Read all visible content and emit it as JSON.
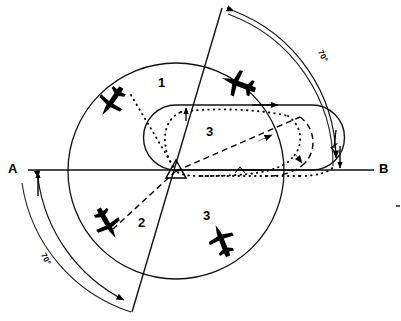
{
  "figure": {
    "type": "diagram",
    "background_color": "#ffffff",
    "line_color": "#000000"
  },
  "endpoints": {
    "left_label": "A",
    "right_label": "B"
  },
  "sector_labels": [
    {
      "id": "sector-1",
      "text": "1",
      "x": 158,
      "y": 76
    },
    {
      "id": "sector-2",
      "text": "2",
      "x": 138,
      "y": 216
    },
    {
      "id": "sector-3-upper",
      "text": "3",
      "x": 206,
      "y": 125
    },
    {
      "id": "sector-3-lower",
      "text": "3",
      "x": 203,
      "y": 209
    }
  ],
  "angle_labels": [
    {
      "id": "angle-top-right",
      "text": "70°",
      "x": 323,
      "y": 49,
      "rotation": 62
    },
    {
      "id": "angle-bottom-left",
      "text": "70°",
      "x": 46,
      "y": 252,
      "rotation": 62
    }
  ],
  "aircraft": [
    {
      "id": "aircraft-sector-1",
      "x": 112,
      "y": 101,
      "rotation": 125,
      "scale": 1.0
    },
    {
      "id": "aircraft-sector-3-upper",
      "x": 239,
      "y": 84,
      "rotation": 200,
      "scale": 1.05
    },
    {
      "id": "aircraft-sector-2",
      "x": 107,
      "y": 223,
      "rotation": 60,
      "scale": 1.0
    },
    {
      "id": "aircraft-sector-3-lower",
      "x": 222,
      "y": 241,
      "rotation": 248,
      "scale": 1.0
    }
  ],
  "station": {
    "id": "vor-station",
    "x": 176,
    "y": 171,
    "size": 11
  },
  "geometry": {
    "center": {
      "x": 176,
      "y": 171
    },
    "inner_circle_radius": 108,
    "outer_arc_radius": 160,
    "bearing_line_angle_deg": 70,
    "holding_pattern": {
      "outbound_leg_y": 105,
      "inbound_leg_y": 170,
      "left_turn_center_x": 176,
      "right_turn_center_x": 310
    }
  }
}
